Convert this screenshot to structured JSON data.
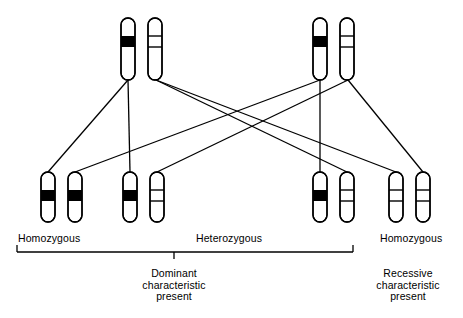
{
  "figure": {
    "type": "genetics-inheritance-diagram",
    "title": "",
    "colors": {
      "stroke": "#000000",
      "dominant_band_fill": "#000000",
      "recessive_band_fill": "#ffffff",
      "background": "#ffffff"
    }
  },
  "legend_labels": {
    "homozygous": "Homozygous",
    "heterozygous": "Heterozygous"
  },
  "zygosity_labels": [
    {
      "id": "left",
      "text": "Homozygous",
      "x": 18,
      "y": 233
    },
    {
      "id": "center",
      "text": "Heterozygous",
      "x": 196,
      "y": 233
    },
    {
      "id": "right",
      "text": "Homozygous",
      "x": 380,
      "y": 233
    }
  ],
  "captions": [
    {
      "id": "dominant",
      "lines": [
        "Dominant",
        "characteristic",
        "present"
      ],
      "center_x": 174,
      "y": 268
    },
    {
      "id": "recessive",
      "lines": [
        "Recessive",
        "characteristic",
        "present"
      ],
      "center_x": 408,
      "y": 268
    }
  ],
  "brackets": [
    {
      "id": "dominant-bracket",
      "x1": 17,
      "x2": 353,
      "y": 252,
      "tick_x": 174,
      "tick_length": 7,
      "end_tick_length": 7
    }
  ],
  "parents": [
    {
      "id": "parent-left",
      "genotype": "heterozygous",
      "chromosomes": [
        {
          "id": "p1-dominant",
          "allele": "dominant",
          "band": "solid",
          "x": 128,
          "y": 18
        },
        {
          "id": "p1-recessive",
          "allele": "recessive",
          "band": "outline",
          "x": 155,
          "y": 18
        }
      ]
    },
    {
      "id": "parent-right",
      "genotype": "heterozygous",
      "chromosomes": [
        {
          "id": "p2-dominant",
          "allele": "dominant",
          "band": "solid",
          "x": 320,
          "y": 18
        },
        {
          "id": "p2-recessive",
          "allele": "recessive",
          "band": "outline",
          "x": 347,
          "y": 18
        }
      ]
    }
  ],
  "offspring": [
    {
      "id": "offspring-1",
      "genotype": "homozygous-dominant",
      "zygosity": "Homozygous",
      "characteristic": "Dominant",
      "chromosomes": [
        {
          "id": "o1-a",
          "allele": "dominant",
          "band": "solid",
          "x": 48,
          "y": 172
        },
        {
          "id": "o1-b",
          "allele": "dominant",
          "band": "solid",
          "x": 75,
          "y": 172
        }
      ]
    },
    {
      "id": "offspring-2",
      "genotype": "heterozygous",
      "zygosity": "Heterozygous",
      "characteristic": "Dominant",
      "chromosomes": [
        {
          "id": "o2-a",
          "allele": "dominant",
          "band": "solid",
          "x": 130,
          "y": 172
        },
        {
          "id": "o2-b",
          "allele": "recessive",
          "band": "outline",
          "x": 157,
          "y": 172
        }
      ]
    },
    {
      "id": "offspring-3",
      "genotype": "heterozygous",
      "zygosity": "Heterozygous",
      "characteristic": "Dominant",
      "chromosomes": [
        {
          "id": "o3-a",
          "allele": "dominant",
          "band": "solid",
          "x": 320,
          "y": 172
        },
        {
          "id": "o3-b",
          "allele": "recessive",
          "band": "outline",
          "x": 347,
          "y": 172
        }
      ]
    },
    {
      "id": "offspring-4",
      "genotype": "homozygous-recessive",
      "zygosity": "Homozygous",
      "characteristic": "Recessive",
      "chromosomes": [
        {
          "id": "o4-a",
          "allele": "recessive",
          "band": "outline",
          "x": 396,
          "y": 172
        },
        {
          "id": "o4-b",
          "allele": "recessive",
          "band": "outline",
          "x": 423,
          "y": 172
        }
      ]
    }
  ],
  "connectors": [
    {
      "id": "c1",
      "from": "p1-dominant",
      "to": "o1-a",
      "x1": 128,
      "y1": 80,
      "x2": 48,
      "y2": 172
    },
    {
      "id": "c2",
      "from": "p1-dominant",
      "to": "o2-a",
      "x1": 128,
      "y1": 80,
      "x2": 130,
      "y2": 172
    },
    {
      "id": "c3",
      "from": "p1-recessive",
      "to": "o3-b",
      "x1": 156,
      "y1": 80,
      "x2": 347,
      "y2": 172
    },
    {
      "id": "c4",
      "from": "p1-recessive",
      "to": "o4-a",
      "x1": 156,
      "y1": 80,
      "x2": 396,
      "y2": 172
    },
    {
      "id": "c5",
      "from": "p2-dominant",
      "to": "o2-b",
      "x1": 320,
      "y1": 80,
      "x2": 75,
      "y2": 172
    },
    {
      "id": "c6",
      "from": "p2-dominant",
      "to": "o3-a",
      "x1": 320,
      "y1": 80,
      "x2": 320,
      "y2": 172
    },
    {
      "id": "c7",
      "from": "p2-recessive",
      "to": "o2-b",
      "x1": 348,
      "y1": 80,
      "x2": 157,
      "y2": 172
    },
    {
      "id": "c8",
      "from": "p2-recessive",
      "to": "o4-b",
      "x1": 348,
      "y1": 80,
      "x2": 423,
      "y2": 172
    }
  ],
  "chromosome_shape": {
    "width": 14,
    "height": 62,
    "offspring_height": 50,
    "corner_radius": 7,
    "band_offset_from_top": 18,
    "band_height": 11,
    "stroke_width": 1.4
  }
}
